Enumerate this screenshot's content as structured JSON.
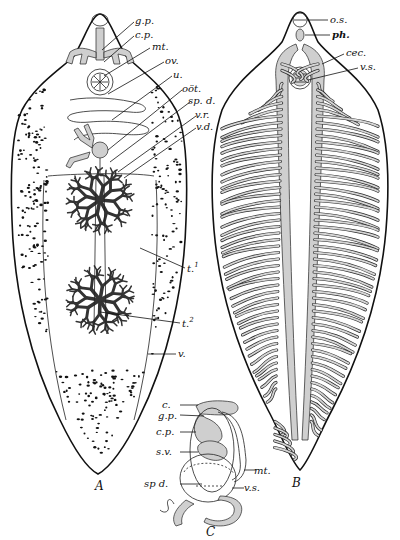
{
  "figure": {
    "specimens": [
      {
        "id": "A",
        "caption": "A",
        "labels": [
          {
            "key": "gp",
            "text": "g.p."
          },
          {
            "key": "cp",
            "text": "c.p."
          },
          {
            "key": "mt",
            "text": "mt."
          },
          {
            "key": "ov",
            "text": "ov."
          },
          {
            "key": "u",
            "text": "u."
          },
          {
            "key": "oot",
            "text": "oöt."
          },
          {
            "key": "spd",
            "text": "sp. d."
          },
          {
            "key": "vr",
            "text": "v.r."
          },
          {
            "key": "vd",
            "text": "v.d."
          },
          {
            "key": "t1",
            "text": "t."
          },
          {
            "key": "t2",
            "text": "t."
          },
          {
            "key": "v",
            "text": "v."
          }
        ],
        "superscripts": {
          "t1": "1",
          "t2": "2"
        }
      },
      {
        "id": "B",
        "caption": "B",
        "labels": [
          {
            "key": "os",
            "text": "o.s."
          },
          {
            "key": "ph",
            "text": "ph."
          },
          {
            "key": "cec",
            "text": "cec."
          },
          {
            "key": "vs",
            "text": "v.s."
          }
        ]
      },
      {
        "id": "C",
        "caption": "C",
        "labels": [
          {
            "key": "c",
            "text": "c."
          },
          {
            "key": "gp",
            "text": "g.p."
          },
          {
            "key": "cp",
            "text": "c.p."
          },
          {
            "key": "sv",
            "text": "s.v."
          },
          {
            "key": "mt",
            "text": "mt."
          },
          {
            "key": "spd",
            "text": "sp d."
          },
          {
            "key": "vs",
            "text": "v.s."
          }
        ]
      }
    ]
  }
}
